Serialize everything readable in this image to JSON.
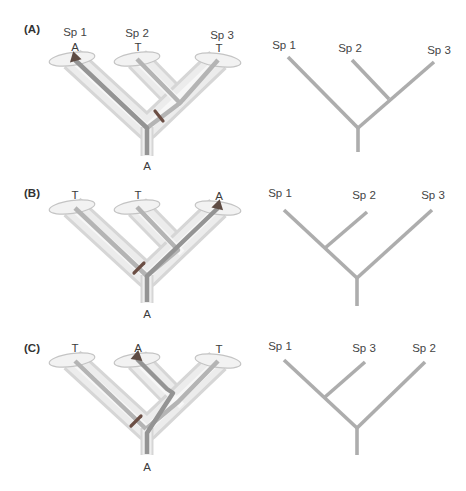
{
  "figure": {
    "description_colors": {
      "tube_fill": "#ececec",
      "tube_edge": "#d6d6d6",
      "gene_lineage_light": "#b4b4b4",
      "gene_lineage_dark": "#949494",
      "mutation_marker": "#6b4e44",
      "line_tree_branch": "#adadad",
      "text": "#3f3f3f"
    },
    "panels": [
      {
        "label": "(A)",
        "tube_tree": {
          "tips": [
            {
              "species": "Sp 1",
              "allele": "A",
              "allele_arrow": true
            },
            {
              "species": "Sp 2",
              "allele": "T",
              "allele_arrow": false
            },
            {
              "species": "Sp 3",
              "allele": "T",
              "allele_arrow": false
            }
          ],
          "root_allele": "A"
        },
        "line_tree": {
          "tips": [
            "Sp 1",
            "Sp 2",
            "Sp 3"
          ],
          "topology": "(Sp 1, (Sp 2, Sp 3))"
        }
      },
      {
        "label": "(B)",
        "tube_tree": {
          "tips": [
            {
              "allele": "T",
              "allele_arrow": false
            },
            {
              "allele": "T",
              "allele_arrow": false
            },
            {
              "allele": "A",
              "allele_arrow": true
            }
          ],
          "root_allele": "A"
        },
        "line_tree": {
          "tips": [
            "Sp 1",
            "Sp 2",
            "Sp 3"
          ],
          "topology": "((Sp 1, Sp 2), Sp 3)"
        }
      },
      {
        "label": "(C)",
        "tube_tree": {
          "tips": [
            {
              "allele": "T",
              "allele_arrow": false
            },
            {
              "allele": "A",
              "allele_arrow": true
            },
            {
              "allele": "T",
              "allele_arrow": false
            }
          ],
          "root_allele": "A"
        },
        "line_tree": {
          "tips": [
            "Sp 1",
            "Sp 3",
            "Sp 2"
          ],
          "topology": "((Sp 1, Sp 3), Sp 2)"
        }
      }
    ]
  }
}
